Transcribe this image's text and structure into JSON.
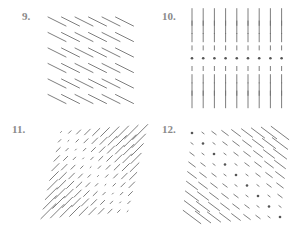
{
  "figure": {
    "panels": [
      {
        "id": "9",
        "label": "9.",
        "description": "Uniform vector field, all arrows pointing down-right with equal length",
        "grid": {
          "cols": 6,
          "rows": 6
        },
        "field": "uniform",
        "direction": [
          1,
          -0.55
        ]
      },
      {
        "id": "10",
        "label": "10.",
        "description": "Vertical vector field; top rows point down, middle row zero (dots), bottom rows point up; magnitude grows with distance from center row",
        "grid": {
          "cols": 9,
          "rows": 9
        },
        "field": "vertical_to_center"
      },
      {
        "id": "11",
        "label": "11.",
        "description": "Vector field along the diagonal y=x direction; magnitude increases toward upper-right and lower-left corners",
        "grid": {
          "cols": 10,
          "rows": 10
        },
        "field": "diagonal_xy"
      },
      {
        "id": "12",
        "label": "12.",
        "description": "Vector field pointing down-right; dots along main diagonal, magnitude grows away from diagonal toward top-right and bottom-left",
        "grid": {
          "cols": 9,
          "rows": 9
        },
        "field": "antidiagonal_growth"
      }
    ]
  },
  "colors": {
    "stroke": "#6f6f6f",
    "label": "#8a8a8a",
    "dot": "#555555"
  }
}
